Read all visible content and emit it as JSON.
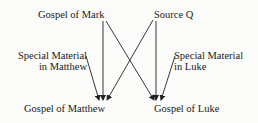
{
  "diagram": {
    "type": "flow",
    "nodes": {
      "mark": {
        "label": "Gospel of Mark"
      },
      "q": {
        "label": "Source Q"
      },
      "special_matthew": {
        "line1": "Special Material",
        "line2": "in Matthew"
      },
      "special_luke": {
        "line1": "Special Material",
        "line2": "in Luke"
      },
      "matthew": {
        "label": "Gospel of Matthew"
      },
      "luke": {
        "label": "Gospel of Luke"
      }
    },
    "edges": [
      {
        "from": "mark",
        "to": "matthew"
      },
      {
        "from": "mark",
        "to": "luke"
      },
      {
        "from": "q",
        "to": "matthew"
      },
      {
        "from": "q",
        "to": "luke"
      },
      {
        "from": "special_matthew",
        "to": "matthew"
      },
      {
        "from": "special_luke",
        "to": "luke"
      }
    ],
    "line_color": "#222222",
    "text_color": "#1a1a1a"
  }
}
